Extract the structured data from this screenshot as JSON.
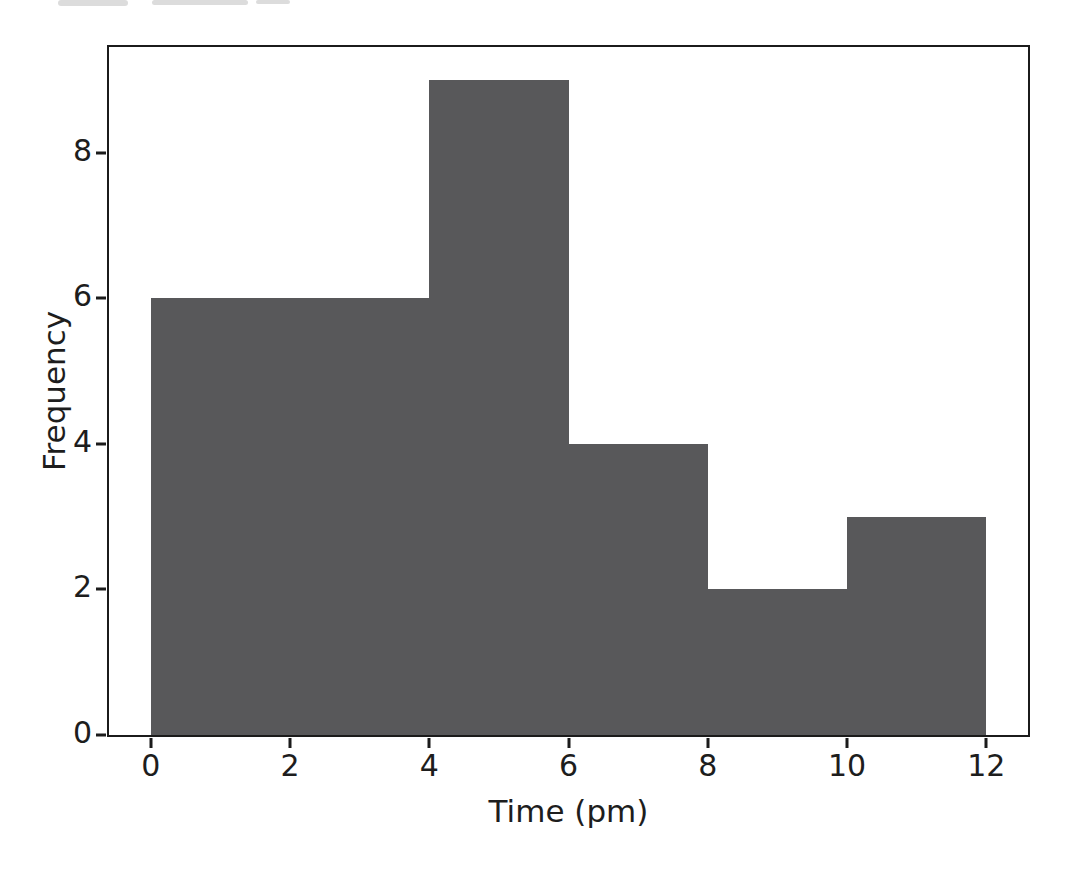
{
  "figure": {
    "background": "#ffffff",
    "spine_color": "#1b1b1b",
    "text_color": "#1d1d1d",
    "artifact_color": "#dcdcdc"
  },
  "chart_data": {
    "type": "bar",
    "subtype": "histogram",
    "title": "",
    "xlabel": "Time (pm)",
    "ylabel": "Frequency",
    "bin_edges": [
      0,
      2,
      4,
      6,
      8,
      10,
      12
    ],
    "frequencies": [
      6,
      6,
      9,
      4,
      2,
      3
    ],
    "xticks": [
      0,
      2,
      4,
      6,
      8,
      10,
      12
    ],
    "yticks": [
      0,
      2,
      4,
      6,
      8
    ],
    "xlim": [
      -0.6,
      12.6
    ],
    "ylim": [
      0,
      9.45
    ],
    "bar_color": "#58585a",
    "grid": false,
    "legend_position": "none"
  }
}
